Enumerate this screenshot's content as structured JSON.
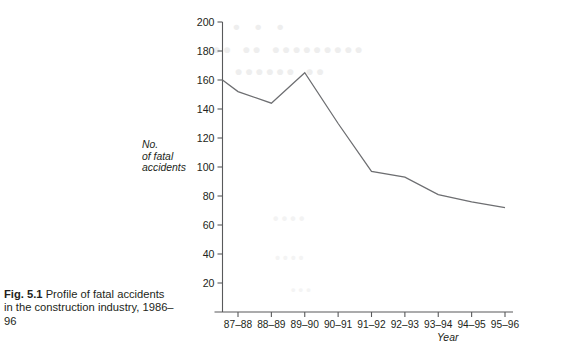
{
  "figure": {
    "label": "Fig. 5.1",
    "caption": "Profile of fatal accidents in the construction industry, 1986–96"
  },
  "ghost_text": {
    "line1": "• • •",
    "line2": "••••••••• •• ••",
    "line3": "•• ••••••",
    "line4": "••••",
    "line5": "••••",
    "line6": "•••"
  },
  "chart_data": {
    "type": "line",
    "title": "",
    "xlabel": "Year",
    "ylabel": "No. of fatal accidents",
    "ylabel_lines": [
      "No.",
      "of fatal",
      "accidents"
    ],
    "categories": [
      "87–88",
      "88–89",
      "89–90",
      "90–91",
      "91–92",
      "92–93",
      "93–94",
      "94–95",
      "95–96"
    ],
    "values": [
      152,
      144,
      165,
      130,
      97,
      93,
      81,
      76,
      72
    ],
    "axis_start_value": 160,
    "series": [
      {
        "name": "No. of fatal accidents",
        "values": [
          152,
          144,
          165,
          130,
          97,
          93,
          81,
          76,
          72
        ]
      }
    ],
    "ylim": [
      0,
      200
    ],
    "yticks": [
      20,
      40,
      60,
      80,
      100,
      120,
      140,
      160,
      180,
      200
    ],
    "ytick_labels": [
      "20",
      "40",
      "60",
      "80",
      "100",
      "120",
      "140",
      "160",
      "180",
      "200"
    ],
    "grid": false,
    "legend": false,
    "line_color": "#6d6e71",
    "axis_color": "#58595b"
  }
}
